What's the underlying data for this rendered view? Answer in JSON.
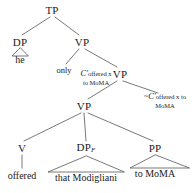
{
  "figure": {
    "kind": "syntax-tree",
    "colors": {
      "background": "#ffffff",
      "text": "#1a1a1a",
      "line": "#555555"
    }
  },
  "nodes": {
    "tp": {
      "label": "TP",
      "x": 52,
      "y": 10
    },
    "dp_subject": {
      "label": "DP",
      "x": 20,
      "y": 42
    },
    "vp_top": {
      "label": "VP",
      "x": 82,
      "y": 42
    },
    "vp_mid": {
      "label": "VP",
      "x": 120,
      "y": 74
    },
    "vp_low": {
      "label": "VP",
      "x": 84,
      "y": 106
    },
    "v_head": {
      "label": "V",
      "x": 22,
      "y": 148
    },
    "dp_focus": {
      "label": "DP",
      "subscript": "F",
      "x": 86,
      "y": 148
    },
    "pp": {
      "label": "PP",
      "x": 155,
      "y": 148
    }
  },
  "terminals": {
    "he": {
      "text": "he",
      "x": 20,
      "y": 60
    },
    "offered": {
      "text": "offered",
      "x": 22,
      "y": 176
    },
    "that_modigliani": {
      "text": "that Modigliani",
      "x": 86,
      "y": 178
    },
    "to_moma": {
      "text": "to MoMA",
      "x": 155,
      "y": 174
    }
  },
  "annotations": {
    "only": {
      "text": "only",
      "x": 64,
      "y": 70
    },
    "c_prime_left": {
      "operator": "",
      "head": "C",
      "prime": "′",
      "gloss_line1": "offered x",
      "gloss_line2": "to MoMA",
      "x": 96,
      "y": 77
    },
    "c_prime_right": {
      "operator": "~",
      "head": "C",
      "prime": "′",
      "gloss_line1": "offered x to",
      "gloss_line2": "MoMA",
      "x": 165,
      "y": 101
    }
  }
}
